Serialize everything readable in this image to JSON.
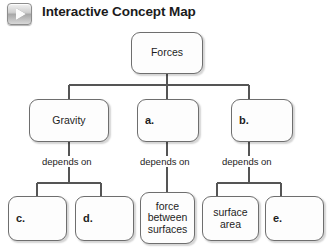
{
  "header": {
    "title": "Interactive Concept Map",
    "play_icon": "play-icon"
  },
  "diagram": {
    "root": {
      "label": "Forces"
    },
    "level2": [
      {
        "id": "gravity",
        "label": "Gravity",
        "style": "concept"
      },
      {
        "id": "a",
        "label": "a.",
        "style": "letter"
      },
      {
        "id": "b",
        "label": "b.",
        "style": "letter"
      }
    ],
    "edge_labels": [
      {
        "id": "edge-gravity",
        "label": "depends on"
      },
      {
        "id": "edge-a",
        "label": "depends on"
      },
      {
        "id": "edge-b",
        "label": "depends on"
      }
    ],
    "level3": [
      {
        "id": "c",
        "label": "c.",
        "style": "letter"
      },
      {
        "id": "d",
        "label": "d.",
        "style": "letter"
      },
      {
        "id": "force",
        "label": "force between surfaces",
        "style": "concept"
      },
      {
        "id": "surface",
        "label": "surface area",
        "style": "concept"
      },
      {
        "id": "e",
        "label": "e.",
        "style": "letter"
      }
    ]
  },
  "colors": {
    "node_border": "#6e6e6e",
    "node_fill": "#fdfdfd",
    "wire": "#555555",
    "title_text": "#1b1b1b"
  }
}
